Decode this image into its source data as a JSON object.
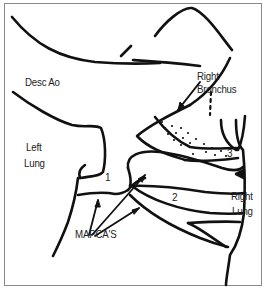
{
  "diagram": {
    "labels": {
      "desc_ao": "Desc Ao",
      "right_bronchus": "Right Bronchus",
      "left_lung_line1": "Left",
      "left_lung_line2": "Lung",
      "right_lung_line1": "Right",
      "right_lung_line2": "Lung",
      "mapcas": "MAPCA'S"
    },
    "numbers": {
      "n1": "1",
      "n2": "2",
      "n3": "3"
    },
    "colors": {
      "stroke": "#111111",
      "border": "#8a8a8a",
      "text": "#222222"
    }
  }
}
